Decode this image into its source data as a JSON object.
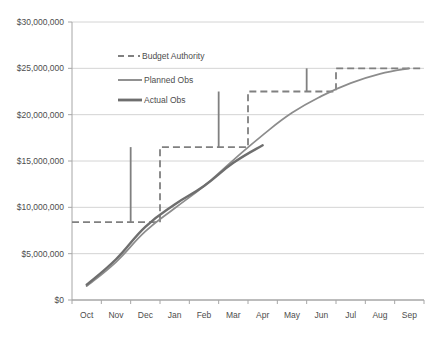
{
  "chart_data": {
    "type": "line",
    "title": "",
    "xlabel": "",
    "ylabel": "",
    "grid": true,
    "legend_position": "inside-top-left",
    "categories": [
      "Oct",
      "Nov",
      "Dec",
      "Jan",
      "Feb",
      "Mar",
      "Apr",
      "May",
      "Jun",
      "Jul",
      "Aug",
      "Sep"
    ],
    "ylim": [
      0,
      30000000
    ],
    "ytick_values": [
      0,
      5000000,
      10000000,
      15000000,
      20000000,
      25000000,
      30000000
    ],
    "ytick_labels": [
      "$0",
      "$5,000,000",
      "$10,000,000",
      "$15,000,000",
      "$20,000,000",
      "$25,000,000",
      "$30,000,000"
    ],
    "series": [
      {
        "name": "Budget Authority",
        "style": "dashed-step",
        "color": "#808080",
        "values": [
          8400000,
          8400000,
          8400000,
          16500000,
          16500000,
          16500000,
          22500000,
          22500000,
          22500000,
          25000000,
          25000000,
          25000000
        ],
        "steps": [
          {
            "month": "Dec",
            "from": 8400000,
            "to": 16500000
          },
          {
            "month": "Mar",
            "from": 16500000,
            "to": 22500000
          },
          {
            "month": "Jun",
            "from": 22500000,
            "to": 25000000
          }
        ]
      },
      {
        "name": "Planned Obs",
        "style": "solid-thin",
        "color": "#8c8c8c",
        "values": [
          1500000,
          4100000,
          7400000,
          9900000,
          12300000,
          15100000,
          17800000,
          20200000,
          22000000,
          23400000,
          24400000,
          25000000
        ]
      },
      {
        "name": "Actual Obs",
        "style": "solid-thick",
        "color": "#6e6e6e",
        "values": [
          1650000,
          4400000,
          7900000,
          10300000,
          12300000,
          14800000,
          16700000,
          null,
          null,
          null,
          null,
          null
        ]
      }
    ]
  },
  "legend": {
    "items": [
      {
        "label": "Budget Authority",
        "style": "dashed"
      },
      {
        "label": "Planned Obs",
        "style": "solid-thin"
      },
      {
        "label": "Actual Obs",
        "style": "solid-thick"
      }
    ]
  },
  "axis": {
    "y_labels": [
      "$30,000,000",
      "$25,000,000",
      "$20,000,000",
      "$15,000,000",
      "$10,000,000",
      "$5,000,000",
      "$0"
    ],
    "x_labels": [
      "Oct",
      "Nov",
      "Dec",
      "Jan",
      "Feb",
      "Mar",
      "Apr",
      "May",
      "Jun",
      "Jul",
      "Aug",
      "Sep"
    ]
  },
  "colors": {
    "grid": "#d4d4d4",
    "axis": "#a6a6a6",
    "budget": "#808080",
    "planned": "#8c8c8c",
    "actual": "#6e6e6e",
    "text": "#4d4d4d",
    "background": "#ffffff"
  }
}
